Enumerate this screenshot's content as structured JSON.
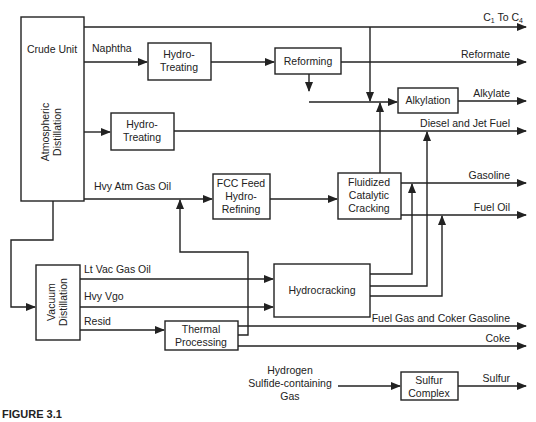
{
  "figure_label": "FIGURE 3.1",
  "units": {
    "crude": {
      "title": "Crude Unit",
      "subtitle_line1": "Atmospheric",
      "subtitle_line2": "Distillation"
    },
    "hydrotreating1": {
      "line1": "Hydro-",
      "line2": "Treating"
    },
    "reforming": {
      "label": "Reforming"
    },
    "alkylation": {
      "label": "Alkylation"
    },
    "hydrotreating2": {
      "line1": "Hydro-",
      "line2": "Treating"
    },
    "fcc_feed": {
      "line1": "FCC Feed",
      "line2": "Hydro-",
      "line3": "Refining"
    },
    "fcc": {
      "line1": "Fluidized",
      "line2": "Catalytic",
      "line3": "Cracking"
    },
    "vacuum": {
      "line1": "Vacuum",
      "line2": "Distillation"
    },
    "hydrocracking": {
      "label": "Hydrocracking"
    },
    "thermal": {
      "line1": "Thermal",
      "line2": "Processing"
    },
    "sulfur": {
      "line1": "Sulfur",
      "line2": "Complex"
    }
  },
  "streams": {
    "naphtha": "Naphtha",
    "hvy_atm_gas_oil": "Hvy Atm Gas Oil",
    "lt_vac_gas_oil": "Lt Vac Gas Oil",
    "hvy_vgo": "Hvy Vgo",
    "resid": "Resid",
    "h2s_line1": "Hydrogen",
    "h2s_line2": "Sulfide-containing",
    "h2s_line3": "Gas"
  },
  "products": {
    "c1_c4_prefix": "C",
    "c1_c4_sub1": "1",
    "c1_c4_mid": " To C",
    "c1_c4_sub2": "4",
    "reformate": "Reformate",
    "alkylate": "Alkylate",
    "diesel_jet": "Diesel and Jet Fuel",
    "gasoline": "Gasoline",
    "fuel_oil": "Fuel Oil",
    "fuel_gas_coker": "Fuel Gas and Coker Gasoline",
    "coke": "Coke",
    "sulfur": "Sulfur"
  }
}
